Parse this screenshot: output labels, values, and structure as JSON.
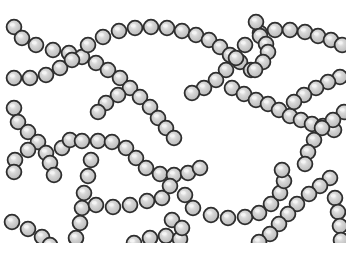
{
  "illustration": {
    "subject": "chains of spherical cocci bacteria (streptococci)",
    "background_color": "#ffffff",
    "bead_fill": "#c9c9c9",
    "bead_stroke": "#2e2e2e",
    "bead_highlight": "#f4f4f4",
    "bead_radius": 7.4,
    "clip": {
      "x": 0,
      "y": 0,
      "w": 346,
      "h": 243
    }
  },
  "chains": [
    {
      "name": "chain-top-left-down",
      "beads": [
        [
          14,
          27
        ],
        [
          22,
          38
        ],
        [
          36,
          45
        ],
        [
          53,
          50
        ],
        [
          69,
          53
        ],
        [
          82,
          57
        ],
        [
          96,
          63
        ],
        [
          108,
          70
        ],
        [
          120,
          78
        ],
        [
          130,
          88
        ],
        [
          140,
          97
        ],
        [
          150,
          107
        ],
        [
          158,
          118
        ],
        [
          166,
          128
        ],
        [
          174,
          138
        ]
      ]
    },
    {
      "name": "chain-left-up",
      "beads": [
        [
          14,
          78
        ],
        [
          30,
          78
        ],
        [
          46,
          75
        ],
        [
          60,
          68
        ],
        [
          72,
          60
        ]
      ]
    },
    {
      "name": "chain-top-arc",
      "beads": [
        [
          88,
          45
        ],
        [
          103,
          37
        ],
        [
          119,
          31
        ],
        [
          135,
          28
        ],
        [
          151,
          27
        ],
        [
          167,
          28
        ],
        [
          182,
          31
        ],
        [
          196,
          35
        ],
        [
          209,
          40
        ],
        [
          220,
          47
        ],
        [
          230,
          55
        ],
        [
          240,
          62
        ],
        [
          251,
          70
        ]
      ]
    },
    {
      "name": "chain-top-right",
      "beads": [
        [
          260,
          33
        ],
        [
          275,
          30
        ],
        [
          290,
          30
        ],
        [
          305,
          32
        ],
        [
          318,
          36
        ],
        [
          331,
          40
        ],
        [
          342,
          45
        ]
      ]
    },
    {
      "name": "chain-right-loop",
      "beads": [
        [
          256,
          22
        ],
        [
          260,
          36
        ],
        [
          266,
          44
        ],
        [
          268,
          52
        ],
        [
          263,
          62
        ],
        [
          255,
          70
        ]
      ]
    },
    {
      "name": "chain-center-diag",
      "beads": [
        [
          245,
          45
        ],
        [
          236,
          58
        ],
        [
          226,
          70
        ],
        [
          216,
          80
        ],
        [
          204,
          88
        ],
        [
          192,
          93
        ]
      ]
    },
    {
      "name": "chain-mid-left",
      "beads": [
        [
          118,
          95
        ],
        [
          106,
          103
        ],
        [
          98,
          112
        ]
      ]
    },
    {
      "name": "chain-center-right",
      "beads": [
        [
          232,
          88
        ],
        [
          244,
          94
        ],
        [
          256,
          100
        ],
        [
          268,
          104
        ],
        [
          279,
          110
        ],
        [
          290,
          116
        ],
        [
          301,
          120
        ],
        [
          312,
          124
        ],
        [
          323,
          126
        ],
        [
          334,
          130
        ]
      ]
    },
    {
      "name": "chain-right-upper",
      "beads": [
        [
          340,
          77
        ],
        [
          328,
          82
        ],
        [
          316,
          88
        ],
        [
          304,
          95
        ],
        [
          294,
          102
        ]
      ]
    },
    {
      "name": "chain-far-right-down",
      "beads": [
        [
          344,
          112
        ],
        [
          333,
          120
        ],
        [
          322,
          128
        ],
        [
          314,
          140
        ],
        [
          308,
          152
        ],
        [
          305,
          164
        ]
      ]
    },
    {
      "name": "chain-left-mid",
      "beads": [
        [
          14,
          108
        ],
        [
          18,
          122
        ],
        [
          28,
          132
        ],
        [
          38,
          142
        ],
        [
          46,
          153
        ],
        [
          50,
          163
        ],
        [
          54,
          175
        ]
      ]
    },
    {
      "name": "chain-left-mid-2",
      "beads": [
        [
          28,
          150
        ],
        [
          15,
          160
        ],
        [
          14,
          172
        ]
      ]
    },
    {
      "name": "chain-center-loop",
      "beads": [
        [
          62,
          148
        ],
        [
          70,
          140
        ],
        [
          82,
          141
        ],
        [
          98,
          141
        ],
        [
          112,
          142
        ],
        [
          126,
          148
        ],
        [
          136,
          158
        ],
        [
          146,
          168
        ],
        [
          160,
          174
        ],
        [
          174,
          175
        ],
        [
          188,
          173
        ],
        [
          200,
          168
        ]
      ]
    },
    {
      "name": "chain-center-vertical",
      "beads": [
        [
          91,
          160
        ],
        [
          88,
          176
        ],
        [
          84,
          193
        ],
        [
          82,
          208
        ],
        [
          80,
          223
        ],
        [
          76,
          238
        ]
      ]
    },
    {
      "name": "chain-lower-center",
      "beads": [
        [
          96,
          205
        ],
        [
          113,
          207
        ],
        [
          130,
          205
        ],
        [
          147,
          201
        ],
        [
          162,
          198
        ],
        [
          170,
          186
        ]
      ]
    },
    {
      "name": "chain-lower-arc",
      "beads": [
        [
          185,
          195
        ],
        [
          193,
          208
        ],
        [
          211,
          215
        ],
        [
          228,
          218
        ],
        [
          245,
          217
        ],
        [
          259,
          213
        ],
        [
          271,
          204
        ],
        [
          280,
          193
        ],
        [
          284,
          181
        ],
        [
          282,
          170
        ]
      ]
    },
    {
      "name": "chain-right-diag",
      "beads": [
        [
          330,
          178
        ],
        [
          320,
          186
        ],
        [
          309,
          194
        ],
        [
          297,
          204
        ],
        [
          288,
          214
        ],
        [
          279,
          224
        ],
        [
          270,
          234
        ],
        [
          259,
          242
        ]
      ]
    },
    {
      "name": "chain-right-vertical",
      "beads": [
        [
          335,
          198
        ],
        [
          338,
          212
        ],
        [
          340,
          226
        ],
        [
          341,
          240
        ]
      ]
    },
    {
      "name": "chain-lower-left",
      "beads": [
        [
          12,
          222
        ],
        [
          28,
          229
        ],
        [
          42,
          237
        ],
        [
          50,
          245
        ]
      ]
    },
    {
      "name": "chain-bottom-center",
      "beads": [
        [
          134,
          243
        ],
        [
          150,
          238
        ],
        [
          166,
          236
        ],
        [
          180,
          239
        ]
      ]
    },
    {
      "name": "chain-bottom-left-2",
      "beads": [
        [
          172,
          220
        ],
        [
          182,
          228
        ]
      ]
    }
  ]
}
